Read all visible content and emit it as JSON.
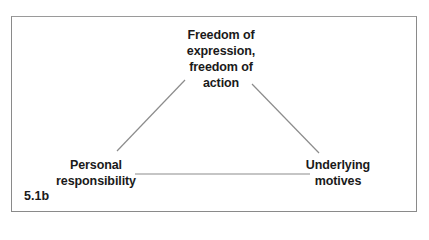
{
  "diagram": {
    "type": "triangle-relationship",
    "figure_label": "5.1b",
    "nodes": [
      {
        "id": "top",
        "lines": [
          "Freedom of",
          "expression,",
          "freedom of",
          "action"
        ]
      },
      {
        "id": "left",
        "lines": [
          "Personal",
          "responsibility"
        ]
      },
      {
        "id": "right",
        "lines": [
          "Underlying",
          "motives"
        ]
      }
    ],
    "edges": [
      {
        "from": "left",
        "to": "top"
      },
      {
        "from": "top",
        "to": "right"
      },
      {
        "from": "left",
        "to": "right"
      }
    ],
    "colors": {
      "line": "#808080",
      "text": "#1a1a1a",
      "border": "#8a8a8a"
    }
  }
}
